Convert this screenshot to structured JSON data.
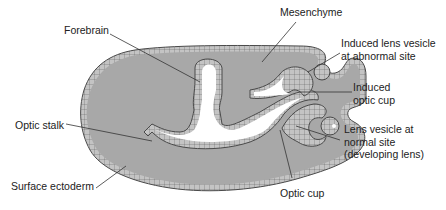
{
  "diagram": {
    "type": "biology-illustration",
    "colors": {
      "tissue_fill": "#a8a8a8",
      "epithelium_fill": "#c4c4c4",
      "outline": "#4a4a4a",
      "lumen": "#ffffff",
      "leader_line": "#333333",
      "text": "#222222"
    },
    "labels": {
      "forebrain": "Forebrain",
      "mesenchyme": "Mesenchyme",
      "induced_lens_vesicle": "Induced lens vesicle\nat abnormal site",
      "induced_optic_cup": "Induced\noptic cup",
      "optic_stalk": "Optic stalk",
      "lens_vesicle_normal": "Lens vesicle at\nnormal site\n(developing lens)",
      "surface_ectoderm": "Surface ectoderm",
      "optic_cup": "Optic cup"
    }
  }
}
